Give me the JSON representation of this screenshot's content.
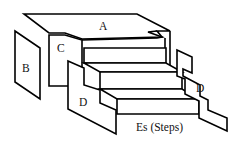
{
  "diagram": {
    "labels": {
      "a": "A",
      "b": "B",
      "c": "C",
      "d_left": "D",
      "d_right": "D",
      "steps": "Es (Steps)"
    },
    "colors": {
      "stroke": "#000000",
      "fill": "#ffffff",
      "text": "#111111"
    }
  }
}
